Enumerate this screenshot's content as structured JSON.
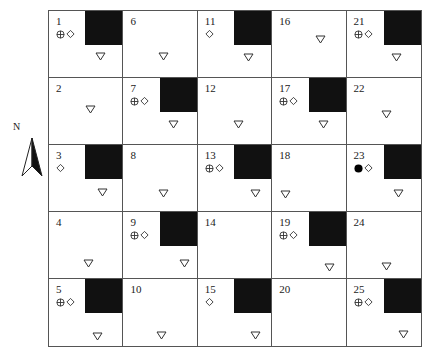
{
  "north_arrow": {
    "label": "N"
  },
  "grid": {
    "columns": 5,
    "rows": 5,
    "cells": [
      {
        "id": "1",
        "block": true,
        "symbols": [
          "crosshair-circle",
          "diamond"
        ],
        "triangle": {
          "x": 46,
          "y": 36
        }
      },
      {
        "id": "2",
        "block": false,
        "symbols": [],
        "triangle": {
          "x": 36,
          "y": 22
        }
      },
      {
        "id": "3",
        "block": true,
        "symbols": [
          "diamond"
        ],
        "triangle": {
          "x": 48,
          "y": 38
        }
      },
      {
        "id": "4",
        "block": false,
        "symbols": [],
        "triangle": {
          "x": 34,
          "y": 42
        }
      },
      {
        "id": "5",
        "block": true,
        "symbols": [
          "crosshair-circle",
          "diamond"
        ],
        "triangle": {
          "x": 43,
          "y": 48
        }
      },
      {
        "id": "6",
        "block": false,
        "symbols": [],
        "triangle": {
          "x": 35,
          "y": 36
        }
      },
      {
        "id": "7",
        "block": true,
        "symbols": [
          "crosshair-circle",
          "diamond"
        ],
        "triangle": {
          "x": 45,
          "y": 37
        }
      },
      {
        "id": "8",
        "block": false,
        "symbols": [],
        "triangle": {
          "x": 35,
          "y": 39
        }
      },
      {
        "id": "9",
        "block": true,
        "symbols": [
          "crosshair-circle",
          "diamond"
        ],
        "triangle": {
          "x": 56,
          "y": 42
        }
      },
      {
        "id": "10",
        "block": false,
        "symbols": [],
        "triangle": {
          "x": 33,
          "y": 47
        }
      },
      {
        "id": "11",
        "block": true,
        "symbols": [
          "diamond"
        ],
        "triangle": {
          "x": 45,
          "y": 37
        }
      },
      {
        "id": "12",
        "block": false,
        "symbols": [],
        "triangle": {
          "x": 35,
          "y": 37
        }
      },
      {
        "id": "13",
        "block": true,
        "symbols": [
          "crosshair-circle",
          "diamond"
        ],
        "triangle": {
          "x": 52,
          "y": 39
        }
      },
      {
        "id": "14",
        "block": false,
        "symbols": [],
        "triangle": null
      },
      {
        "id": "15",
        "block": true,
        "symbols": [
          "diamond"
        ],
        "triangle": {
          "x": 52,
          "y": 47
        }
      },
      {
        "id": "16",
        "block": false,
        "symbols": [],
        "triangle": {
          "x": 43,
          "y": 19
        }
      },
      {
        "id": "17",
        "block": true,
        "symbols": [
          "crosshair-circle",
          "diamond"
        ],
        "triangle": {
          "x": 46,
          "y": 37
        }
      },
      {
        "id": "18",
        "block": false,
        "symbols": [],
        "triangle": {
          "x": 8,
          "y": 40
        }
      },
      {
        "id": "19",
        "block": true,
        "symbols": [
          "crosshair-circle",
          "diamond"
        ],
        "triangle": {
          "x": 52,
          "y": 46
        }
      },
      {
        "id": "20",
        "block": false,
        "symbols": [],
        "triangle": null
      },
      {
        "id": "21",
        "block": true,
        "symbols": [
          "crosshair-circle",
          "diamond"
        ],
        "triangle": {
          "x": 44,
          "y": 37
        }
      },
      {
        "id": "22",
        "block": false,
        "symbols": [],
        "triangle": {
          "x": 34,
          "y": 27
        }
      },
      {
        "id": "23",
        "block": true,
        "symbols": [
          "filled-circle",
          "diamond"
        ],
        "triangle": {
          "x": 46,
          "y": 39
        }
      },
      {
        "id": "24",
        "block": false,
        "symbols": [],
        "triangle": {
          "x": 34,
          "y": 45
        }
      },
      {
        "id": "25",
        "block": true,
        "symbols": [
          "crosshair-circle",
          "diamond"
        ],
        "triangle": {
          "x": 51,
          "y": 46
        }
      }
    ]
  }
}
